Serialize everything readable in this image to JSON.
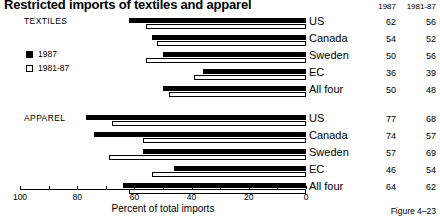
{
  "title": "Restricted imports of textiles and apparel",
  "figure_caption": "Figure 4–23",
  "table": {
    "col_1987": "1987",
    "col_1981_87": "1981-87"
  },
  "legend": {
    "items": [
      {
        "label": "1987",
        "swatch": "filled"
      },
      {
        "label": "1981-87",
        "swatch": "hollow"
      }
    ]
  },
  "axis": {
    "title": "Percent of total imports",
    "tick_labels": [
      "100",
      "80",
      "60",
      "40",
      "20",
      "0"
    ]
  },
  "groups": [
    {
      "name": "TEXTILES"
    },
    {
      "name": "APPAREL"
    }
  ],
  "chart_data": {
    "type": "bar",
    "orientation": "horizontal",
    "title": "Restricted imports of textiles and apparel",
    "xlabel": "Percent of total imports",
    "ylabel": "",
    "xlim": [
      100,
      0
    ],
    "x_axis_reversed": true,
    "xticks": [
      100,
      80,
      60,
      40,
      20,
      0
    ],
    "minor_tick_step": 10,
    "grid": false,
    "legend_position": "upper-left",
    "series": [
      {
        "name": "1987",
        "color": "#000000",
        "style": "filled"
      },
      {
        "name": "1981-87",
        "color": "#ffffff",
        "style": "hollow"
      }
    ],
    "groups": [
      {
        "name": "TEXTILES",
        "categories": [
          "US",
          "Canada",
          "Sweden",
          "EC",
          "All four"
        ],
        "values_1987": [
          62,
          54,
          50,
          36,
          50
        ],
        "values_1981_87": [
          56,
          52,
          56,
          39,
          48
        ]
      },
      {
        "name": "APPAREL",
        "categories": [
          "US",
          "Canada",
          "Sweden",
          "EC",
          "All four"
        ],
        "values_1987": [
          77,
          74,
          57,
          46,
          64
        ],
        "values_1981_87": [
          68,
          57,
          69,
          54,
          62
        ]
      }
    ]
  }
}
